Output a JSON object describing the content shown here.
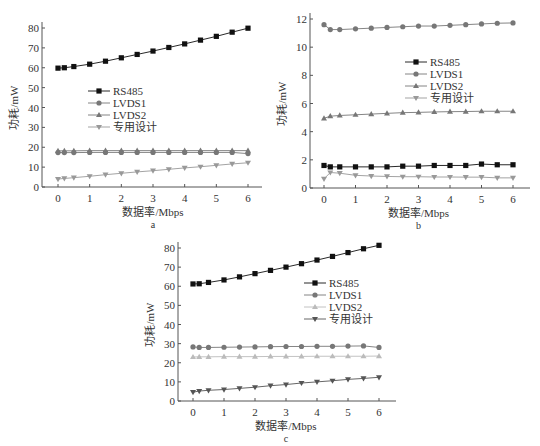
{
  "chart_data": [
    {
      "id": "a",
      "type": "line",
      "caption": "a",
      "xlabel": "数据率/Mbps",
      "ylabel": "功耗/mW",
      "x": [
        0,
        0.2,
        0.5,
        1,
        1.5,
        2,
        2.5,
        3,
        3.5,
        4,
        4.5,
        5,
        5.5,
        6
      ],
      "xticks": [
        0,
        1,
        2,
        3,
        4,
        5,
        6
      ],
      "xlim": [
        -0.4,
        6.5
      ],
      "yticks": [
        0,
        10,
        20,
        30,
        40,
        50,
        60,
        70,
        80
      ],
      "ylim": [
        0,
        85
      ],
      "grid": false,
      "legend_position": "center-left",
      "series": [
        {
          "name": "RS485",
          "marker": "square",
          "color": "#111111",
          "values": [
            59.8,
            60.0,
            60.6,
            61.8,
            63.3,
            65.0,
            66.7,
            68.4,
            70.2,
            72.0,
            73.9,
            75.8,
            77.9,
            79.9
          ]
        },
        {
          "name": "LVDS1",
          "marker": "circle",
          "color": "#777777",
          "values": [
            17.3,
            17.3,
            17.3,
            17.4,
            17.4,
            17.4,
            17.4,
            17.4,
            17.4,
            17.4,
            17.4,
            17.4,
            17.4,
            16.8
          ]
        },
        {
          "name": "LVDS2",
          "marker": "triangle-up",
          "color": "#777777",
          "values": [
            18.2,
            18.2,
            18.2,
            18.3,
            18.3,
            18.3,
            18.3,
            18.3,
            18.3,
            18.3,
            18.3,
            18.3,
            18.3,
            18.3
          ]
        },
        {
          "name": "专用设计",
          "marker": "triangle-down",
          "color": "#999999",
          "values": [
            4.0,
            4.3,
            4.7,
            5.4,
            6.2,
            6.9,
            7.6,
            8.2,
            8.9,
            9.6,
            10.2,
            10.9,
            11.6,
            12.2
          ]
        }
      ]
    },
    {
      "id": "b",
      "type": "line",
      "caption": "b",
      "xlabel": "数据率/Mbps",
      "ylabel": "功耗/mW",
      "x": [
        0,
        0.2,
        0.5,
        1,
        1.5,
        2,
        2.5,
        3,
        3.5,
        4,
        4.5,
        5,
        5.5,
        6
      ],
      "xticks": [
        0,
        1,
        2,
        3,
        4,
        5,
        6
      ],
      "xlim": [
        -0.5,
        6.2
      ],
      "yticks": [
        0,
        2,
        4,
        6,
        8,
        10,
        12
      ],
      "ylim": [
        0,
        12.2
      ],
      "grid": false,
      "legend_position": "center-right",
      "series": [
        {
          "name": "RS485",
          "marker": "square",
          "color": "#111111",
          "values": [
            1.6,
            1.5,
            1.5,
            1.5,
            1.5,
            1.5,
            1.55,
            1.55,
            1.6,
            1.6,
            1.6,
            1.7,
            1.65,
            1.65
          ]
        },
        {
          "name": "LVDS1",
          "marker": "circle",
          "color": "#777777",
          "values": [
            11.6,
            11.25,
            11.25,
            11.3,
            11.35,
            11.4,
            11.45,
            11.5,
            11.5,
            11.55,
            11.6,
            11.65,
            11.7,
            11.72
          ]
        },
        {
          "name": "LVDS2",
          "marker": "triangle-up",
          "color": "#777777",
          "values": [
            4.95,
            5.1,
            5.15,
            5.2,
            5.25,
            5.3,
            5.35,
            5.37,
            5.4,
            5.42,
            5.43,
            5.45,
            5.45,
            5.45
          ]
        },
        {
          "name": "专用设计",
          "marker": "triangle-down",
          "color": "#999999",
          "values": [
            0.65,
            1.1,
            1.05,
            0.9,
            0.85,
            0.82,
            0.8,
            0.8,
            0.78,
            0.78,
            0.77,
            0.77,
            0.72,
            0.72
          ]
        }
      ]
    },
    {
      "id": "c",
      "type": "line",
      "caption": "c",
      "xlabel": "数据率/Mbps",
      "ylabel": "功耗/mW",
      "x": [
        0,
        0.2,
        0.5,
        1,
        1.5,
        2,
        2.5,
        3,
        3.5,
        4,
        4.5,
        5,
        5.5,
        6
      ],
      "xticks": [
        0,
        1,
        2,
        3,
        4,
        5,
        6
      ],
      "xlim": [
        -0.5,
        6.5
      ],
      "yticks": [
        0,
        10,
        20,
        30,
        40,
        50,
        60,
        70,
        80
      ],
      "ylim": [
        0,
        85
      ],
      "grid": false,
      "legend_position": "center-right",
      "series": [
        {
          "name": "RS485",
          "marker": "square",
          "color": "#111111",
          "values": [
            61.2,
            61.3,
            62.0,
            63.3,
            64.9,
            66.6,
            68.3,
            70.0,
            71.8,
            73.7,
            75.6,
            77.6,
            79.6,
            81.4
          ]
        },
        {
          "name": "LVDS1",
          "marker": "circle",
          "color": "#777777",
          "values": [
            28.3,
            28.0,
            28.0,
            28.1,
            28.2,
            28.3,
            28.4,
            28.5,
            28.5,
            28.6,
            28.6,
            28.7,
            28.8,
            28.0
          ]
        },
        {
          "name": "LVDS2",
          "marker": "triangle-up",
          "color": "#bbbbbb",
          "values": [
            23.0,
            23.1,
            23.1,
            23.2,
            23.2,
            23.2,
            23.3,
            23.3,
            23.3,
            23.4,
            23.4,
            23.4,
            23.4,
            23.5
          ]
        },
        {
          "name": "专用设计",
          "marker": "triangle-down",
          "color": "#555555",
          "values": [
            4.6,
            5.2,
            5.6,
            6.0,
            6.6,
            7.2,
            8.0,
            8.6,
            9.4,
            10.0,
            10.6,
            11.3,
            11.8,
            12.4
          ]
        }
      ]
    }
  ],
  "layout": {
    "charts": [
      {
        "left": 42,
        "top": 28,
        "bottom": 187,
        "x0px": 58,
        "x6px": 248,
        "axis_right": 262,
        "legend": {
          "x": 88,
          "y": 91
        }
      },
      {
        "left": 310,
        "top": 19,
        "bottom": 188,
        "x0px": 324,
        "x6px": 513,
        "axis_right": 530,
        "legend": {
          "x": 405,
          "y": 62
        }
      },
      {
        "left": 178,
        "top": 248,
        "bottom": 401,
        "x0px": 193,
        "x6px": 379,
        "axis_right": 396,
        "legend": {
          "x": 304,
          "y": 283
        }
      }
    ]
  }
}
